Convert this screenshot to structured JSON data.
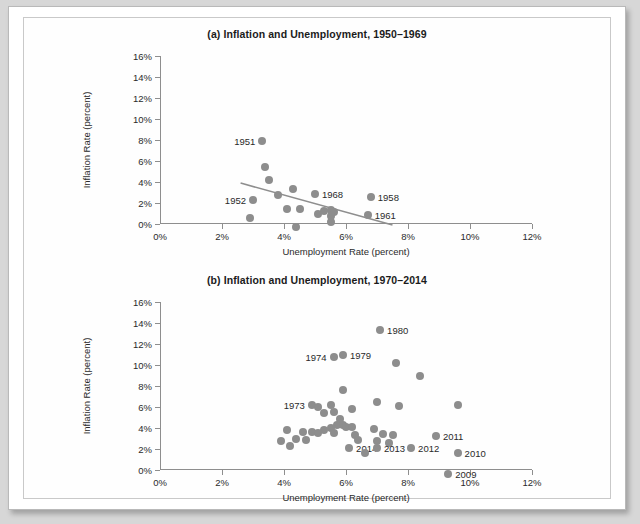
{
  "figure": {
    "axis_title_x": "Unemployment Rate (percent)",
    "axis_title_y": "Inflation Rate (percent)",
    "dot_color": "#8d8d8d",
    "axis_color": "#8e8e8e"
  },
  "chart_data": [
    {
      "type": "scatter",
      "title": "(a) Inflation and Unemployment, 1950–1969",
      "xlabel": "Unemployment Rate (percent)",
      "ylabel": "Inflation Rate (percent)",
      "xlim": [
        0,
        12
      ],
      "ylim": [
        0,
        16
      ],
      "xticks": [
        0,
        2,
        4,
        6,
        8,
        10,
        12
      ],
      "yticks": [
        0,
        2,
        4,
        6,
        8,
        10,
        12,
        14,
        16
      ],
      "xticklabels": [
        "0%",
        "2%",
        "4%",
        "6%",
        "8%",
        "10%",
        "12%"
      ],
      "yticklabels": [
        "0%",
        "2%",
        "4%",
        "6%",
        "8%",
        "10%",
        "12%",
        "14%",
        "16%"
      ],
      "grid": false,
      "legend": "none",
      "points": [
        {
          "x": 3.3,
          "y": 7.9,
          "label": "1951",
          "label_side": "left"
        },
        {
          "x": 3.4,
          "y": 5.4,
          "label": "",
          "label_side": ""
        },
        {
          "x": 3.5,
          "y": 4.2,
          "label": "",
          "label_side": ""
        },
        {
          "x": 4.3,
          "y": 3.3,
          "label": "",
          "label_side": ""
        },
        {
          "x": 3.8,
          "y": 2.8,
          "label": "",
          "label_side": ""
        },
        {
          "x": 3.0,
          "y": 2.3,
          "label": "1952",
          "label_side": "left"
        },
        {
          "x": 2.9,
          "y": 0.6,
          "label": "",
          "label_side": ""
        },
        {
          "x": 4.1,
          "y": 1.4,
          "label": "",
          "label_side": ""
        },
        {
          "x": 4.5,
          "y": 1.4,
          "label": "",
          "label_side": ""
        },
        {
          "x": 4.4,
          "y": -0.3,
          "label": "",
          "label_side": ""
        },
        {
          "x": 5.1,
          "y": 1.0,
          "label": "",
          "label_side": ""
        },
        {
          "x": 5.3,
          "y": 1.2,
          "label": "",
          "label_side": ""
        },
        {
          "x": 5.5,
          "y": 1.3,
          "label": "",
          "label_side": ""
        },
        {
          "x": 5.6,
          "y": 1.1,
          "label": "",
          "label_side": ""
        },
        {
          "x": 5.5,
          "y": 0.8,
          "label": "",
          "label_side": ""
        },
        {
          "x": 5.5,
          "y": 0.2,
          "label": "",
          "label_side": ""
        },
        {
          "x": 5.0,
          "y": 2.9,
          "label": "1968",
          "label_side": "right"
        },
        {
          "x": 6.8,
          "y": 2.6,
          "label": "1958",
          "label_side": "right"
        },
        {
          "x": 6.7,
          "y": 0.9,
          "label": "1961",
          "label_side": "right"
        }
      ],
      "trendline": {
        "x1": 2.6,
        "y1": 3.9,
        "x2": 7.5,
        "y2": -0.1
      }
    },
    {
      "type": "scatter",
      "title": "(b) Inflation and Unemployment, 1970–2014",
      "xlabel": "Unemployment Rate (percent)",
      "ylabel": "Inflation Rate (percent)",
      "xlim": [
        0,
        12
      ],
      "ylim": [
        0,
        16
      ],
      "xticks": [
        0,
        2,
        4,
        6,
        8,
        10,
        12
      ],
      "yticks": [
        0,
        2,
        4,
        6,
        8,
        10,
        12,
        14,
        16
      ],
      "xticklabels": [
        "0%",
        "2%",
        "4%",
        "6%",
        "8%",
        "10%",
        "12%"
      ],
      "yticklabels": [
        "0%",
        "2%",
        "4%",
        "6%",
        "8%",
        "10%",
        "12%",
        "14%",
        "16%"
      ],
      "grid": false,
      "legend": "none",
      "points": [
        {
          "x": 7.1,
          "y": 13.3,
          "label": "1980",
          "label_side": "right"
        },
        {
          "x": 5.6,
          "y": 10.8,
          "label": "1974",
          "label_side": "left"
        },
        {
          "x": 5.9,
          "y": 11.0,
          "label": "1979",
          "label_side": "right"
        },
        {
          "x": 7.6,
          "y": 10.2,
          "label": "",
          "label_side": ""
        },
        {
          "x": 8.4,
          "y": 9.0,
          "label": "",
          "label_side": ""
        },
        {
          "x": 5.9,
          "y": 7.6,
          "label": "",
          "label_side": ""
        },
        {
          "x": 7.0,
          "y": 6.5,
          "label": "",
          "label_side": ""
        },
        {
          "x": 7.7,
          "y": 6.1,
          "label": "",
          "label_side": ""
        },
        {
          "x": 9.6,
          "y": 6.2,
          "label": "",
          "label_side": ""
        },
        {
          "x": 5.5,
          "y": 6.2,
          "label": "",
          "label_side": ""
        },
        {
          "x": 4.9,
          "y": 6.2,
          "label": "1973",
          "label_side": "left"
        },
        {
          "x": 5.1,
          "y": 6.0,
          "label": "",
          "label_side": ""
        },
        {
          "x": 5.3,
          "y": 5.4,
          "label": "",
          "label_side": ""
        },
        {
          "x": 5.6,
          "y": 5.5,
          "label": "",
          "label_side": ""
        },
        {
          "x": 5.8,
          "y": 4.9,
          "label": "",
          "label_side": ""
        },
        {
          "x": 5.7,
          "y": 4.3,
          "label": "",
          "label_side": ""
        },
        {
          "x": 5.9,
          "y": 4.3,
          "label": "",
          "label_side": ""
        },
        {
          "x": 6.0,
          "y": 4.1,
          "label": "",
          "label_side": ""
        },
        {
          "x": 6.2,
          "y": 4.1,
          "label": "",
          "label_side": ""
        },
        {
          "x": 5.5,
          "y": 4.0,
          "label": "",
          "label_side": ""
        },
        {
          "x": 5.3,
          "y": 3.8,
          "label": "",
          "label_side": ""
        },
        {
          "x": 4.1,
          "y": 3.8,
          "label": "",
          "label_side": ""
        },
        {
          "x": 4.6,
          "y": 3.6,
          "label": "",
          "label_side": ""
        },
        {
          "x": 4.9,
          "y": 3.6,
          "label": "",
          "label_side": ""
        },
        {
          "x": 5.1,
          "y": 3.5,
          "label": "",
          "label_side": ""
        },
        {
          "x": 5.6,
          "y": 3.5,
          "label": "",
          "label_side": ""
        },
        {
          "x": 4.4,
          "y": 3.0,
          "label": "",
          "label_side": ""
        },
        {
          "x": 4.7,
          "y": 2.9,
          "label": "",
          "label_side": ""
        },
        {
          "x": 3.9,
          "y": 2.8,
          "label": "",
          "label_side": ""
        },
        {
          "x": 4.2,
          "y": 2.3,
          "label": "",
          "label_side": ""
        },
        {
          "x": 6.3,
          "y": 3.3,
          "label": "",
          "label_side": ""
        },
        {
          "x": 6.4,
          "y": 2.9,
          "label": "",
          "label_side": ""
        },
        {
          "x": 6.9,
          "y": 3.9,
          "label": "",
          "label_side": ""
        },
        {
          "x": 7.2,
          "y": 3.4,
          "label": "",
          "label_side": ""
        },
        {
          "x": 7.5,
          "y": 3.3,
          "label": "",
          "label_side": ""
        },
        {
          "x": 7.0,
          "y": 2.8,
          "label": "",
          "label_side": ""
        },
        {
          "x": 7.4,
          "y": 2.6,
          "label": "",
          "label_side": ""
        },
        {
          "x": 6.1,
          "y": 2.1,
          "label": "2014",
          "label_side": "right"
        },
        {
          "x": 7.0,
          "y": 2.1,
          "label": "2013",
          "label_side": "right"
        },
        {
          "x": 6.6,
          "y": 1.6,
          "label": "",
          "label_side": ""
        },
        {
          "x": 8.1,
          "y": 2.1,
          "label": "2012",
          "label_side": "right"
        },
        {
          "x": 8.9,
          "y": 3.2,
          "label": "2011",
          "label_side": "right"
        },
        {
          "x": 9.6,
          "y": 1.6,
          "label": "2010",
          "label_side": "right"
        },
        {
          "x": 9.3,
          "y": -0.4,
          "label": "2009",
          "label_side": "right"
        },
        {
          "x": 6.2,
          "y": 5.8,
          "label": "",
          "label_side": ""
        }
      ],
      "trendline": null
    }
  ]
}
